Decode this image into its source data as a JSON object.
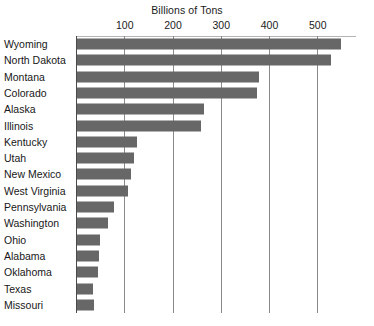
{
  "chart_data": {
    "type": "bar",
    "orientation": "horizontal",
    "title": "Billions of Tons",
    "subtitle": "",
    "xlabel": "",
    "ylabel": "",
    "xlim": [
      0,
      560
    ],
    "xticks": [
      100,
      200,
      300,
      400,
      500
    ],
    "xtick_labels": [
      "100",
      "200",
      "300",
      "400",
      "500"
    ],
    "grid": "vertical",
    "legend": null,
    "bar_color": "#676767",
    "categories": [
      "Wyoming",
      "North Dakota",
      "Montana",
      "Colorado",
      "Alaska",
      "Illinois",
      "Kentucky",
      "Utah",
      "New Mexico",
      "West Virginia",
      "Pennsylvania",
      "Washington",
      "Ohio",
      "Alabama",
      "Oklahoma",
      "Texas",
      "Missouri"
    ],
    "values": [
      548,
      527,
      378,
      373,
      264,
      257,
      125,
      119,
      112,
      106,
      77,
      65,
      48,
      46,
      44,
      34,
      36
    ]
  }
}
